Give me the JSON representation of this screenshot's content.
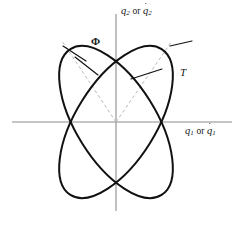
{
  "figure": {
    "type": "geometric-diagram",
    "background_color": "#ffffff",
    "curve_color": "#111111",
    "axis_color": "#8c8c8c",
    "dashed_color": "#b9b9b9"
  },
  "axes": {
    "origin": {
      "x": 116,
      "y": 122
    },
    "x_axis": {
      "x1": 12,
      "y1": 122,
      "x2": 232,
      "y2": 122
    },
    "y_axis": {
      "x1": 116,
      "y1": 14,
      "x2": 116,
      "y2": 211
    },
    "x_label": {
      "name": "x-axis-label",
      "q": "q",
      "sub": "1",
      "conjunction": "or",
      "qdot": "q",
      "qdot_sub": "1",
      "text": "q1 or q̇1"
    },
    "y_label": {
      "name": "y-axis-label",
      "q": "q",
      "sub": "2",
      "conjunction": "or",
      "qdot": "q",
      "qdot_sub": "2",
      "text": "q2 or q̇2"
    }
  },
  "curves": [
    {
      "name": "ellipse-phi",
      "label": "Φ",
      "label_position": {
        "x": 91,
        "y": 36
      },
      "cx": 116,
      "cy": 122,
      "rx": 40,
      "ry": 86,
      "rotation_deg": -32,
      "stroke": "#111111",
      "stroke_width": 2.0
    },
    {
      "name": "ellipse-t",
      "label": "T",
      "label_position": {
        "x": 180,
        "y": 67
      },
      "cx": 116,
      "cy": 122,
      "rx": 40,
      "ry": 86,
      "rotation_deg": 32,
      "stroke": "#111111",
      "stroke_width": 2.0
    }
  ],
  "dashed_lines": [
    {
      "name": "dashed-principal-axis-phi",
      "x1": 62,
      "y1": 41,
      "x2": 116,
      "y2": 122,
      "note": "major axis direction of the Phi ellipse, extended past the curve"
    },
    {
      "name": "dashed-principal-axis-t",
      "x1": 172,
      "y1": 41,
      "x2": 116,
      "y2": 122,
      "note": "major axis direction of the T ellipse, extended past the curve"
    }
  ],
  "tangent_marks": [
    {
      "name": "tangent-mark-upper-left-outer",
      "x1": 63,
      "y1": 46,
      "x2": 86,
      "y2": 61
    },
    {
      "name": "tangent-mark-upper-left-inner",
      "x1": 75,
      "y1": 57,
      "x2": 98,
      "y2": 75
    },
    {
      "name": "tangent-mark-upper-right-outer",
      "x1": 170,
      "y1": 46,
      "x2": 192,
      "y2": 41
    },
    {
      "name": "tangent-mark-upper-right-inner",
      "x1": 131,
      "y1": 79,
      "x2": 162,
      "y2": 69
    }
  ],
  "intersections": {
    "x_axis_left": {
      "x": 69,
      "y": 122
    },
    "x_axis_right": {
      "x": 160,
      "y": 122
    }
  }
}
